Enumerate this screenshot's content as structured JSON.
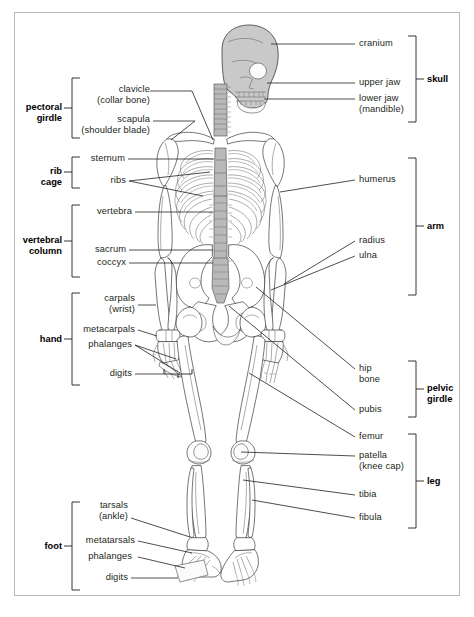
{
  "diagram": {
    "view": "anterior",
    "colors": {
      "line": "#231f20",
      "border": "#b9b9b9",
      "bone_fill": "#ffffff",
      "bone_stroke": "#3a3a3a",
      "skull_fill": "#c9c9c9",
      "spine_fill": "#b9b9b9",
      "background": "#ffffff"
    }
  },
  "left_labels": [
    {
      "id": "clavicle",
      "text": "clavicle\n(collar bone)"
    },
    {
      "id": "scapula",
      "text": "scapula\n(shoulder blade)"
    },
    {
      "id": "sternum",
      "text": "sternum"
    },
    {
      "id": "ribs",
      "text": "ribs"
    },
    {
      "id": "vertebra",
      "text": "vertebra"
    },
    {
      "id": "sacrum",
      "text": "sacrum"
    },
    {
      "id": "coccyx",
      "text": "coccyx"
    },
    {
      "id": "carpals",
      "text": "carpals\n(wrist)"
    },
    {
      "id": "metacarpals",
      "text": "metacarpals"
    },
    {
      "id": "phalanges-hand",
      "text": "phalanges"
    },
    {
      "id": "digits-hand",
      "text": "digits"
    },
    {
      "id": "tarsals",
      "text": "tarsals\n(ankle)"
    },
    {
      "id": "metatarsals",
      "text": "metatarsals"
    },
    {
      "id": "phalanges-foot",
      "text": "phalanges"
    },
    {
      "id": "digits-foot",
      "text": "digits"
    }
  ],
  "right_labels": [
    {
      "id": "cranium",
      "text": "cranium"
    },
    {
      "id": "upper-jaw",
      "text": "upper jaw"
    },
    {
      "id": "lower-jaw",
      "text": "lower jaw\n(mandible)"
    },
    {
      "id": "humerus",
      "text": "humerus"
    },
    {
      "id": "radius",
      "text": "radius"
    },
    {
      "id": "ulna",
      "text": "ulna"
    },
    {
      "id": "hip-bone",
      "text": "hip\nbone"
    },
    {
      "id": "pubis",
      "text": "pubis"
    },
    {
      "id": "femur",
      "text": "femur"
    },
    {
      "id": "patella",
      "text": "patella\n(knee cap)"
    },
    {
      "id": "tibia",
      "text": "tibia"
    },
    {
      "id": "fibula",
      "text": "fibula"
    }
  ],
  "group_labels_left": [
    {
      "id": "pectoral-girdle",
      "text": "pectoral\ngirdle"
    },
    {
      "id": "rib-cage",
      "text": "rib\ncage"
    },
    {
      "id": "vertebral-column",
      "text": "vertebral\ncolumn"
    },
    {
      "id": "hand",
      "text": "hand"
    },
    {
      "id": "foot",
      "text": "foot"
    }
  ],
  "group_labels_right": [
    {
      "id": "skull",
      "text": "skull"
    },
    {
      "id": "arm",
      "text": "arm"
    },
    {
      "id": "pelvic-girdle",
      "text": "pelvic\ngirdle"
    },
    {
      "id": "leg",
      "text": "leg"
    }
  ]
}
